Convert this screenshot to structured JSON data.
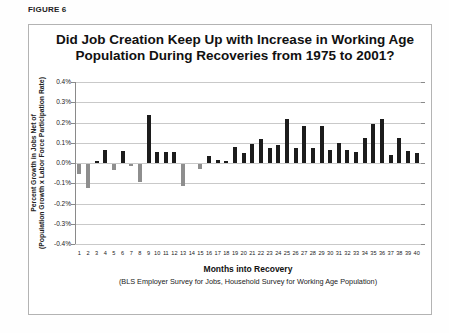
{
  "figure_label": "FIGURE 6",
  "chart_data": {
    "type": "bar",
    "title_line1": "Did Job Creation Keep Up with Increase in Working Age",
    "title_line2": "Population During Recoveries from 1975 to 2001?",
    "ylabel_line1": "Percent Growth in Jobs Net of",
    "ylabel_line2": "(Population Growth x Labor Force Participation Rate)",
    "xlabel": "Months into Recovery",
    "footnote": "(BLS Employer Survey for Jobs, Household Survey for Working Age Population)",
    "categories": [
      1,
      2,
      3,
      4,
      5,
      6,
      7,
      8,
      9,
      10,
      11,
      12,
      13,
      14,
      15,
      16,
      17,
      18,
      19,
      20,
      21,
      22,
      23,
      24,
      25,
      26,
      27,
      28,
      29,
      30,
      31,
      32,
      33,
      34,
      35,
      36,
      37,
      38,
      39,
      40
    ],
    "values": [
      -0.05,
      -0.12,
      0.01,
      0.065,
      -0.03,
      0.06,
      -0.012,
      -0.09,
      0.235,
      0.053,
      0.053,
      0.052,
      -0.11,
      0,
      -0.025,
      0.035,
      0.015,
      0.012,
      0.08,
      0.05,
      0.095,
      0.12,
      0.075,
      0.09,
      0.215,
      0.075,
      0.185,
      0.075,
      0.185,
      0.065,
      0.1,
      0.065,
      0.055,
      0.125,
      0.195,
      0.215,
      0.04,
      0.125,
      0.06,
      0.05
    ],
    "ylim": [
      -0.4,
      0.4
    ],
    "ytick_step": 0.1,
    "ytick_labels": [
      "0.4%",
      "0.3%",
      "0.2%",
      "0.1%",
      "0.0%",
      "-0.1%",
      "-0.2%",
      "-0.3%",
      "-0.4%"
    ],
    "grid": true,
    "legend": "none",
    "positive_color": "#1c1c1c",
    "negative_color": "#8e8e8e",
    "gridline_color": "#c9c9c9"
  }
}
